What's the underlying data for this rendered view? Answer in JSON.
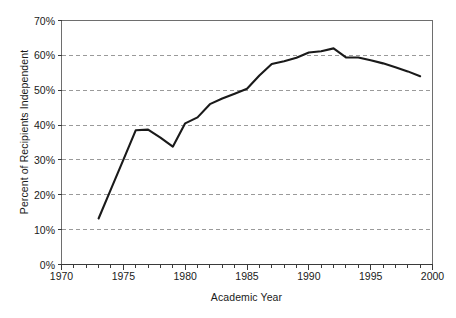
{
  "chart_data": {
    "type": "line",
    "title": "",
    "xlabel": "Academic Year",
    "ylabel": "Percent of Recipients Independent",
    "xlim": [
      1970,
      2000
    ],
    "ylim": [
      0,
      70
    ],
    "grid": true,
    "grid_axis": "y",
    "legend": "none",
    "x_major_step": 5,
    "x_minor_step": 1,
    "y_major_step": 10,
    "y_tick_labels": [
      "0%",
      "10%",
      "20%",
      "30%",
      "40%",
      "50%",
      "60%",
      "70%"
    ],
    "y_tick_values": [
      0,
      10,
      20,
      30,
      40,
      50,
      60,
      70
    ],
    "x_tick_labels": [
      "1970",
      "1975",
      "1980",
      "1985",
      "1990",
      "1995",
      "2000"
    ],
    "x_tick_values": [
      1970,
      1975,
      1980,
      1985,
      1990,
      1995,
      2000
    ],
    "series": [
      {
        "name": "Percent of Recipients Independent",
        "color": "#1a1a1a",
        "x": [
          1973,
          1974,
          1975,
          1976,
          1977,
          1978,
          1979,
          1980,
          1981,
          1982,
          1983,
          1984,
          1985,
          1986,
          1987,
          1988,
          1989,
          1990,
          1991,
          1992,
          1993,
          1994,
          1995,
          1996,
          1997,
          1998,
          1999
        ],
        "values": [
          13.2,
          21.6,
          30.0,
          38.5,
          38.7,
          36.4,
          33.8,
          40.5,
          42.2,
          46.0,
          47.6,
          49.0,
          50.4,
          54.2,
          57.5,
          58.3,
          59.3,
          60.8,
          61.2,
          62.0,
          59.4,
          59.4,
          58.6,
          57.7,
          56.6,
          55.4,
          54.0
        ]
      }
    ]
  },
  "axis": {
    "y_title": "Percent of Recipients Independent",
    "x_title": "Academic Year"
  },
  "colors": {
    "line": "#1a1a1a",
    "grid": "#9a9a9a",
    "axis": "#6e6e6e",
    "background": "#ffffff",
    "text": "#1a1a1a"
  }
}
